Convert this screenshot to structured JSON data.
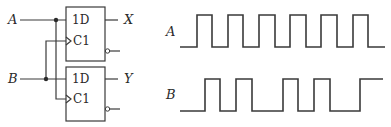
{
  "circuit": {
    "inputs": [
      {
        "label": "A",
        "y": 20,
        "junction_x": 56
      },
      {
        "label": "B",
        "y": 79,
        "junction_x": 46
      }
    ],
    "flip_flops": [
      {
        "name": "ff1",
        "data_pin": "1D",
        "clock_pin": "C1",
        "output": "X",
        "box": [
          66,
          7,
          105,
          61
        ],
        "d_y": 20,
        "c_y": 41,
        "q_y": 20,
        "qbar_y": 51,
        "d_source": "A",
        "clock_source": "B"
      },
      {
        "name": "ff2",
        "data_pin": "1D",
        "clock_pin": "C1",
        "output": "Y",
        "box": [
          66,
          67,
          105,
          121
        ],
        "d_y": 79,
        "c_y": 99,
        "q_y": 79,
        "qbar_y": 109,
        "d_source": "B",
        "clock_source": "A"
      }
    ]
  },
  "waveforms": [
    {
      "label": "A",
      "high_y": 15,
      "low_y": 47,
      "start_x": 180,
      "end_x": 385,
      "initial": "low",
      "edges": [
        197,
        212,
        228,
        243,
        259,
        275,
        290,
        306,
        321,
        337,
        353,
        368
      ]
    },
    {
      "label": "B",
      "high_y": 79,
      "low_y": 111,
      "start_x": 180,
      "end_x": 383,
      "initial": "low",
      "edges": [
        205,
        220,
        236,
        252,
        283,
        298,
        314,
        330,
        360
      ]
    }
  ]
}
